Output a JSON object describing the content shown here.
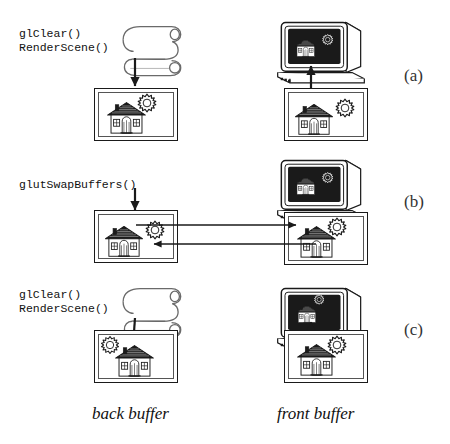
{
  "figure": {
    "rows": [
      {
        "id": "a",
        "marker": "(a)",
        "code": "glClear()\nRenderScene()",
        "back_buffer": {
          "scene": "house-with-sun-overlapping-roof"
        },
        "front_buffer": {
          "scene": "house-and-sun-separate"
        },
        "monitor": {
          "scene": "house-and-sun-separate"
        },
        "arrows": [
          "scroll-to-back-buffer",
          "front-buffer-to-monitor"
        ]
      },
      {
        "id": "b",
        "marker": "(b)",
        "code": "glutSwapBuffers()",
        "back_buffer": {
          "scene": "house-and-sun-separate"
        },
        "front_buffer": {
          "scene": "house-with-sun-overlapping-roof"
        },
        "monitor": {
          "scene": "house-and-sun-separate"
        },
        "arrows": [
          "label-to-back-buffer",
          "back-buffer-to-front-buffer",
          "front-buffer-to-back-buffer"
        ]
      },
      {
        "id": "c",
        "marker": "(c)",
        "code": "glClear()\nRenderScene()",
        "back_buffer": {
          "scene": "house-with-sun-upper-left"
        },
        "front_buffer": {
          "scene": "house-with-sun-overlapping-roof"
        },
        "monitor": {
          "scene": "house-with-sun-overlapping-roof"
        },
        "arrows": [
          "scroll-to-back-buffer",
          "front-buffer-to-monitor"
        ]
      }
    ],
    "captions": {
      "back": "back buffer",
      "front": "front buffer"
    },
    "icons": {
      "scroll": "scroll-icon",
      "monitor": "crt-monitor-icon",
      "house": "house-icon",
      "sun": "sun-icon",
      "arrow": "arrow-icon"
    },
    "colors": {
      "ink": "#1a1a1a",
      "paper": "#ffffff",
      "screen": "#1a1a1a",
      "gray": "#808080"
    }
  }
}
